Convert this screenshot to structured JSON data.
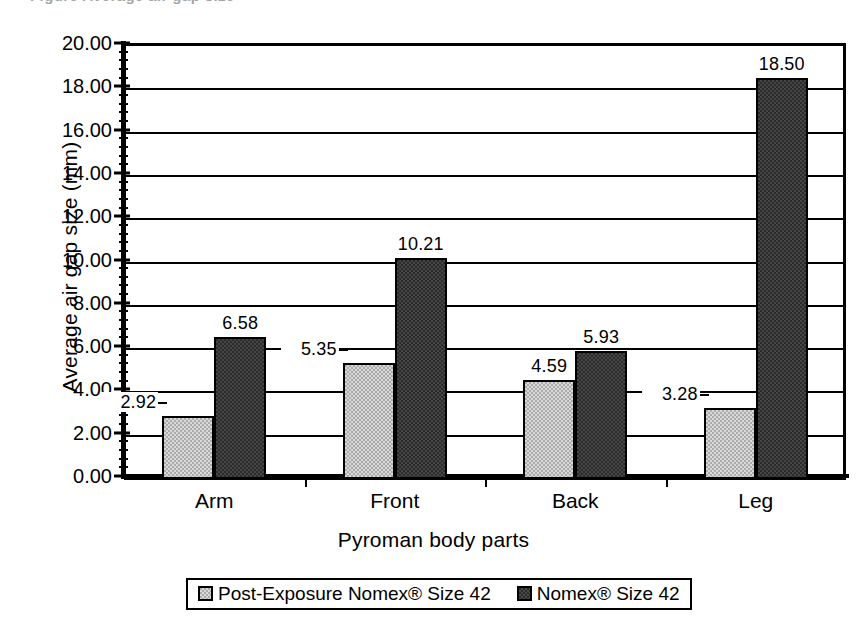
{
  "chart_data": {
    "type": "bar",
    "title": "",
    "xlabel": "Pyroman body parts",
    "ylabel": "Average air gap size (mm)",
    "categories": [
      "Arm",
      "Front",
      "Back",
      "Leg"
    ],
    "series": [
      {
        "name": "Post-Exposure Nomex®  Size 42",
        "values": [
          2.92,
          5.35,
          4.59,
          3.28
        ],
        "labels": [
          "2.92",
          "5.35",
          "4.59",
          "3.28"
        ],
        "color": "#ababab"
      },
      {
        "name": "Nomex® Size 42",
        "values": [
          6.58,
          10.21,
          5.93,
          18.5
        ],
        "labels": [
          "6.58",
          "10.21",
          "5.93",
          "18.50"
        ],
        "color": "#2b2b2b"
      }
    ],
    "ylim": [
      0,
      20
    ],
    "ytick_step": 2,
    "ytick_labels": [
      "0.00",
      "2.00",
      "4.00",
      "6.00",
      "8.00",
      "10.00",
      "12.00",
      "14.00",
      "16.00",
      "18.00",
      "20.00"
    ],
    "grid": true,
    "legend_position": "bottom"
  },
  "legend": {
    "items": [
      {
        "label": "Post-Exposure Nomex®  Size 42",
        "swatch": "light-gray-swatch"
      },
      {
        "label": "Nomex® Size 42",
        "swatch": "dark-gray-swatch"
      }
    ]
  },
  "page": {
    "clipped_header_text": "Figure  Average air gap size"
  }
}
